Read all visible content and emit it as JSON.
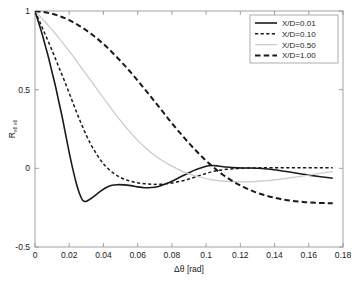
{
  "chart_data": {
    "type": "line",
    "title": "",
    "xlabel": "Δθ  [rad]",
    "ylabel": "R",
    "ylabel_subscript": "vθ vθ",
    "xlim": [
      0,
      0.18
    ],
    "ylim": [
      -0.5,
      1
    ],
    "grid": false,
    "legend_position": "top-right",
    "xticks": [
      "0",
      "0.02",
      "0.04",
      "0.06",
      "0.08",
      "0.1",
      "0.12",
      "0.14",
      "0.16",
      "0.18"
    ],
    "xtick_values": [
      0,
      0.02,
      0.04,
      0.06,
      0.08,
      0.1,
      0.12,
      0.14,
      0.16,
      0.18
    ],
    "yticks": [
      "1",
      "0.5",
      "0",
      "-0.5"
    ],
    "ytick_values": [
      1,
      0.5,
      0,
      -0.5
    ],
    "series": [
      {
        "name": "X/D=0.01",
        "style": "solid",
        "color": "#1a1a1a",
        "width": 1.6,
        "x": [
          0,
          0.002,
          0.004,
          0.006,
          0.008,
          0.01,
          0.012,
          0.014,
          0.016,
          0.018,
          0.02,
          0.022,
          0.024,
          0.026,
          0.028,
          0.03,
          0.033,
          0.036,
          0.039,
          0.042,
          0.045,
          0.048,
          0.052,
          0.056,
          0.06,
          0.064,
          0.068,
          0.072,
          0.076,
          0.08,
          0.085,
          0.09,
          0.095,
          0.1,
          0.103,
          0.107,
          0.112,
          0.118,
          0.124,
          0.13,
          0.136,
          0.142,
          0.148,
          0.154,
          0.16,
          0.166,
          0.172,
          0.174
        ],
        "y": [
          1.0,
          0.93,
          0.86,
          0.78,
          0.7,
          0.61,
          0.52,
          0.42,
          0.32,
          0.21,
          0.1,
          0.0,
          -0.09,
          -0.16,
          -0.205,
          -0.21,
          -0.19,
          -0.165,
          -0.14,
          -0.12,
          -0.108,
          -0.104,
          -0.105,
          -0.11,
          -0.118,
          -0.123,
          -0.122,
          -0.115,
          -0.1,
          -0.082,
          -0.055,
          -0.028,
          -0.005,
          0.013,
          0.018,
          0.015,
          0.008,
          0.003,
          0.002,
          0.001,
          -0.004,
          -0.012,
          -0.022,
          -0.033,
          -0.043,
          -0.052,
          -0.06,
          -0.062
        ]
      },
      {
        "name": "X/D=0.10",
        "style": "dashed-fine",
        "color": "#1a1a1a",
        "width": 1.5,
        "x": [
          0,
          0.003,
          0.006,
          0.009,
          0.012,
          0.015,
          0.018,
          0.021,
          0.024,
          0.027,
          0.03,
          0.033,
          0.036,
          0.039,
          0.042,
          0.046,
          0.05,
          0.054,
          0.058,
          0.062,
          0.066,
          0.07,
          0.075,
          0.08,
          0.085,
          0.09,
          0.095,
          0.1,
          0.104,
          0.108,
          0.114,
          0.12,
          0.126,
          0.132,
          0.138,
          0.144,
          0.15,
          0.156,
          0.162,
          0.168,
          0.174
        ],
        "y": [
          1.0,
          0.925,
          0.85,
          0.775,
          0.695,
          0.615,
          0.535,
          0.45,
          0.365,
          0.285,
          0.21,
          0.145,
          0.09,
          0.042,
          0.005,
          -0.032,
          -0.058,
          -0.076,
          -0.088,
          -0.095,
          -0.1,
          -0.102,
          -0.1,
          -0.093,
          -0.082,
          -0.068,
          -0.05,
          -0.032,
          -0.02,
          -0.012,
          -0.004,
          0.0,
          0.002,
          0.003,
          0.004,
          0.004,
          0.004,
          0.004,
          0.004,
          0.004,
          0.004
        ]
      },
      {
        "name": "X/D=0.50",
        "style": "solid-light",
        "color": "#c9c9c9",
        "width": 1.2,
        "x": [
          0,
          0.004,
          0.008,
          0.012,
          0.016,
          0.02,
          0.025,
          0.03,
          0.035,
          0.04,
          0.045,
          0.05,
          0.055,
          0.06,
          0.065,
          0.07,
          0.075,
          0.08,
          0.084,
          0.088,
          0.093,
          0.098,
          0.104,
          0.11,
          0.116,
          0.122,
          0.128,
          0.134,
          0.14,
          0.146,
          0.152,
          0.158,
          0.164,
          0.17,
          0.174
        ],
        "y": [
          1.0,
          0.955,
          0.905,
          0.855,
          0.8,
          0.745,
          0.672,
          0.597,
          0.522,
          0.447,
          0.373,
          0.303,
          0.238,
          0.178,
          0.126,
          0.082,
          0.045,
          0.014,
          -0.008,
          -0.027,
          -0.046,
          -0.06,
          -0.073,
          -0.081,
          -0.085,
          -0.086,
          -0.084,
          -0.08,
          -0.073,
          -0.065,
          -0.056,
          -0.046,
          -0.036,
          -0.026,
          -0.022
        ]
      },
      {
        "name": "X/D=1.00",
        "style": "dashed-coarse",
        "color": "#1a1a1a",
        "width": 2.0,
        "x": [
          0,
          0.005,
          0.01,
          0.015,
          0.02,
          0.025,
          0.03,
          0.035,
          0.04,
          0.045,
          0.05,
          0.055,
          0.06,
          0.065,
          0.07,
          0.075,
          0.08,
          0.085,
          0.09,
          0.095,
          0.1,
          0.105,
          0.11,
          0.116,
          0.122,
          0.128,
          0.134,
          0.14,
          0.146,
          0.152,
          0.158,
          0.164,
          0.17,
          0.174
        ],
        "y": [
          1.0,
          0.993,
          0.982,
          0.965,
          0.942,
          0.912,
          0.877,
          0.836,
          0.79,
          0.738,
          0.682,
          0.622,
          0.558,
          0.492,
          0.424,
          0.355,
          0.287,
          0.222,
          0.16,
          0.102,
          0.048,
          0.0,
          -0.042,
          -0.085,
          -0.12,
          -0.148,
          -0.17,
          -0.187,
          -0.2,
          -0.209,
          -0.215,
          -0.219,
          -0.221,
          -0.222
        ]
      }
    ]
  },
  "legend": {
    "entries": [
      {
        "label": "X/D=0.01"
      },
      {
        "label": "X/D=0.10"
      },
      {
        "label": "X/D=0.50"
      },
      {
        "label": "X/D=1.00"
      }
    ]
  },
  "axes": {
    "x_title": "Δθ  [rad]",
    "y_title": "R"
  }
}
